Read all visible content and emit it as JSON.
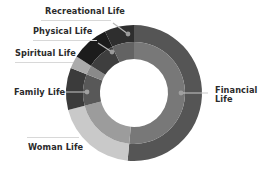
{
  "chart_data": {
    "type": "donut",
    "title": "",
    "center": [
      134,
      93
    ],
    "radii": {
      "outer": 68,
      "middle": 51,
      "inner": 34
    },
    "start_angle_deg": 0,
    "direction": "clockwise",
    "segments": [
      {
        "name": "Financial Life",
        "label": "Financial Life",
        "value": 51.5,
        "outer_color": "#555555",
        "inner_color": "#787878"
      },
      {
        "name": "Woman Life",
        "label": "Woman Life",
        "value": 19.5,
        "outer_color": "#c9c9c9",
        "inner_color": "#9c9c9c"
      },
      {
        "name": "Family Life",
        "label": "Family Life",
        "value": 10.0,
        "outer_color": "#3b3b3b",
        "inner_color": "#585858"
      },
      {
        "name": "Spiritual Life",
        "label": "Spiritual Life",
        "value": 3.0,
        "outer_color": "#ababab",
        "inner_color": "#8a8a8a"
      },
      {
        "name": "Physical Life",
        "label": "Physical Life",
        "value": 9.0,
        "outer_color": "#1c1c1c",
        "inner_color": "#3e3e3e"
      },
      {
        "name": "Recreational Life",
        "label": "Recreational Life",
        "value": 7.0,
        "outer_color": "#2e2e2e",
        "inner_color": "#636363"
      }
    ],
    "legend": "callout-labels"
  },
  "labels": {
    "financial": {
      "line1": "Financial",
      "line2": "Life"
    },
    "woman": "Woman Life",
    "family": "Family Life",
    "spiritual": "Spiritual Life",
    "physical": "Physical Life",
    "recreational": "Recreational Life"
  },
  "colors": {
    "label_text": "#2b2b2b",
    "leader_line": "#bdbdbd",
    "marker_dot": "#9a9a9a"
  }
}
